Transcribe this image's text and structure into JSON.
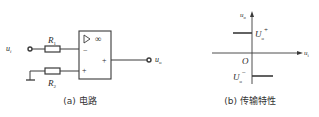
{
  "circuit": {
    "input_label": "u",
    "input_sub": "i",
    "output_label": "u",
    "output_sub": "o",
    "r1_label": "R",
    "r1_sub": "1",
    "r2_label": "R",
    "r2_sub": "2",
    "opamp_symbol": "▷",
    "opamp_gain": "∞",
    "inverting_sign": "−",
    "noninverting_sign": "+",
    "output_sign": "+",
    "caption": "(a) 电路"
  },
  "transfer": {
    "y_axis_label": "u",
    "y_axis_sub": "o",
    "x_axis_label": "u",
    "x_axis_sub": "i",
    "origin_label": "O",
    "upper_level_label": "U",
    "upper_level_sub": "o",
    "upper_level_sup": "+",
    "lower_level_label": "U",
    "lower_level_sub": "o",
    "lower_level_sup": "−",
    "caption": "(b) 传输特性"
  },
  "colors": {
    "line": "#3a3a3a",
    "text": "#2a2a2a"
  }
}
